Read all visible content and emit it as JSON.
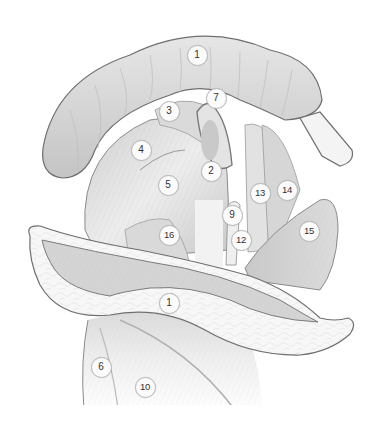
{
  "figure": {
    "type": "anatomical-illustration",
    "style": "grayscale",
    "colors": {
      "background": "#ffffff",
      "outline": "#777777",
      "tissue_light": "#f3f3f3",
      "tissue_mid": "#d9d9d9",
      "tissue_dark": "#b5b5b5",
      "callout_fill": "#fbfbfb",
      "callout_border": "#b9b9b9",
      "callout_text": "#333333"
    }
  },
  "callouts": [
    {
      "label": "1",
      "x": 197,
      "y": 55
    },
    {
      "label": "7",
      "x": 216,
      "y": 98
    },
    {
      "label": "3",
      "x": 169,
      "y": 111
    },
    {
      "label": "4",
      "x": 141,
      "y": 150
    },
    {
      "label": "2",
      "x": 211,
      "y": 171
    },
    {
      "label": "5",
      "x": 168,
      "y": 185
    },
    {
      "label": "13",
      "x": 260,
      "y": 193
    },
    {
      "label": "14",
      "x": 287,
      "y": 190
    },
    {
      "label": "9",
      "x": 232,
      "y": 215
    },
    {
      "label": "16",
      "x": 169,
      "y": 235
    },
    {
      "label": "12",
      "x": 241,
      "y": 240
    },
    {
      "label": "15",
      "x": 309,
      "y": 231
    },
    {
      "label": "1",
      "x": 169,
      "y": 303
    },
    {
      "label": "6",
      "x": 101,
      "y": 367
    },
    {
      "label": "10",
      "x": 145,
      "y": 387
    }
  ]
}
